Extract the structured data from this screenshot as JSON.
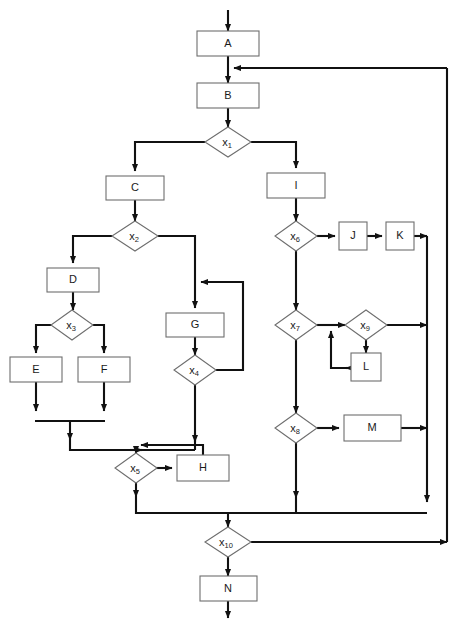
{
  "diagram": {
    "type": "flowchart",
    "background_color": "#ffffff",
    "edge_color": "#111111",
    "box_fill": "#ffffff",
    "box_stroke": "#6e6e6e",
    "label_color": "#1a1a1a",
    "process_nodes": [
      {
        "id": "A",
        "label": "A",
        "x": 228,
        "y": 44
      },
      {
        "id": "B",
        "label": "B",
        "x": 228,
        "y": 96
      },
      {
        "id": "C",
        "label": "C",
        "x": 135,
        "y": 188
      },
      {
        "id": "D",
        "label": "D",
        "x": 73,
        "y": 280
      },
      {
        "id": "E",
        "label": "E",
        "x": 36,
        "y": 370
      },
      {
        "id": "F",
        "label": "F",
        "x": 104,
        "y": 370
      },
      {
        "id": "G",
        "label": "G",
        "x": 195,
        "y": 325
      },
      {
        "id": "H",
        "label": "H",
        "x": 203,
        "y": 468
      },
      {
        "id": "I",
        "label": "I",
        "x": 296,
        "y": 186
      },
      {
        "id": "J",
        "label": "J",
        "x": 353,
        "y": 236
      },
      {
        "id": "K",
        "label": "K",
        "x": 400,
        "y": 236
      },
      {
        "id": "L",
        "label": "L",
        "x": 366,
        "y": 368
      },
      {
        "id": "M",
        "label": "M",
        "x": 372,
        "y": 428
      },
      {
        "id": "N",
        "label": "N",
        "x": 228,
        "y": 589
      }
    ],
    "decision_nodes": [
      {
        "id": "x1",
        "label": "x",
        "sub": "1",
        "x": 228,
        "y": 142
      },
      {
        "id": "x2",
        "label": "x",
        "sub": "2",
        "x": 135,
        "y": 236
      },
      {
        "id": "x3",
        "label": "x",
        "sub": "3",
        "x": 72,
        "y": 325
      },
      {
        "id": "x4",
        "label": "x",
        "sub": "4",
        "x": 195,
        "y": 370
      },
      {
        "id": "x5",
        "label": "x",
        "sub": "5",
        "x": 136,
        "y": 468
      },
      {
        "id": "x6",
        "label": "x",
        "sub": "6",
        "x": 296,
        "y": 236
      },
      {
        "id": "x7",
        "label": "x",
        "sub": "7",
        "x": 296,
        "y": 325
      },
      {
        "id": "x8",
        "label": "x",
        "sub": "8",
        "x": 296,
        "y": 428
      },
      {
        "id": "x9",
        "label": "x",
        "sub": "9",
        "x": 366,
        "y": 325
      },
      {
        "id": "x10",
        "label": "x",
        "sub": "10",
        "x": 228,
        "y": 542
      }
    ],
    "edges": [
      {
        "from": "start",
        "to": "A"
      },
      {
        "from": "A",
        "to": "B"
      },
      {
        "from": "B",
        "to": "x1"
      },
      {
        "from": "x1",
        "to": "C"
      },
      {
        "from": "x1",
        "to": "I"
      },
      {
        "from": "C",
        "to": "x2"
      },
      {
        "from": "x2",
        "to": "D"
      },
      {
        "from": "x2",
        "to": "G"
      },
      {
        "from": "D",
        "to": "x3"
      },
      {
        "from": "x3",
        "to": "E"
      },
      {
        "from": "x3",
        "to": "F"
      },
      {
        "from": "E",
        "to": "merge-EF"
      },
      {
        "from": "F",
        "to": "merge-EF"
      },
      {
        "from": "merge-EF",
        "to": "x5"
      },
      {
        "from": "G",
        "to": "x4"
      },
      {
        "from": "x4",
        "to": "G-loop"
      },
      {
        "from": "x4",
        "to": "x5"
      },
      {
        "from": "x5",
        "to": "H"
      },
      {
        "from": "H",
        "to": "x5-loop"
      },
      {
        "from": "x5",
        "to": "x10"
      },
      {
        "from": "I",
        "to": "x6"
      },
      {
        "from": "x6",
        "to": "J"
      },
      {
        "from": "J",
        "to": "K"
      },
      {
        "from": "K",
        "to": "right-bus"
      },
      {
        "from": "x6",
        "to": "x7"
      },
      {
        "from": "x7",
        "to": "x9"
      },
      {
        "from": "x9",
        "to": "L"
      },
      {
        "from": "L",
        "to": "x9-loop"
      },
      {
        "from": "x9",
        "to": "right-bus"
      },
      {
        "from": "x7",
        "to": "x8"
      },
      {
        "from": "x8",
        "to": "M"
      },
      {
        "from": "M",
        "to": "right-bus"
      },
      {
        "from": "x8",
        "to": "bottom-bus"
      },
      {
        "from": "right-bus",
        "to": "bottom-bus"
      },
      {
        "from": "bottom-bus",
        "to": "x10"
      },
      {
        "from": "x10",
        "to": "outer-return-B"
      },
      {
        "from": "x10",
        "to": "N"
      },
      {
        "from": "N",
        "to": "end"
      }
    ]
  }
}
